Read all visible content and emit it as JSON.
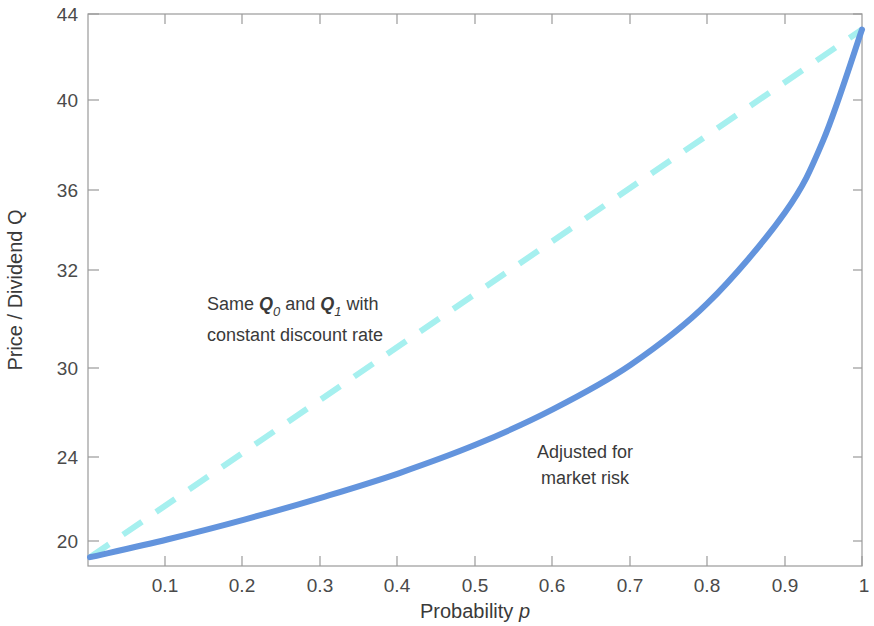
{
  "chart_data": {
    "type": "line",
    "title": "",
    "xlabel": "Probability p",
    "ylabel": "Price / Dividend Q",
    "xlim": [
      0,
      1
    ],
    "ylim": [
      19.0,
      44.0
    ],
    "grid": false,
    "legend_position": "none",
    "xticks": [
      "0.1",
      "0.2",
      "0.3",
      "0.4",
      "0.5",
      "0.6",
      "0.7",
      "0.8",
      "0.9",
      "1"
    ],
    "xtick_values": [
      0.1,
      0.2,
      0.3,
      0.4,
      0.5,
      0.6,
      0.7,
      0.8,
      0.9,
      1.0
    ],
    "yticks": [
      "44",
      "40",
      "36",
      "32",
      "30",
      "24",
      "20"
    ],
    "ytick_values": [
      44,
      40,
      36,
      32,
      30,
      24,
      20
    ],
    "series": [
      {
        "name": "Same Q0 and Q1 with constant discount rate",
        "style": "dashed",
        "color": "#a6f0ef",
        "x": [
          0.0,
          0.1,
          0.2,
          0.3,
          0.4,
          0.5,
          0.6,
          0.7,
          0.8,
          0.9,
          1.0
        ],
        "values": [
          19.4,
          21.8,
          24.2,
          26.6,
          29.0,
          31.4,
          33.8,
          36.2,
          38.6,
          41.0,
          43.3
        ]
      },
      {
        "name": "Adjusted for market risk",
        "style": "solid",
        "color": "#6394dd",
        "x": [
          0.0,
          0.1,
          0.2,
          0.3,
          0.4,
          0.5,
          0.6,
          0.7,
          0.8,
          0.9,
          0.95,
          1.0
        ],
        "values": [
          19.4,
          20.2,
          21.1,
          22.1,
          23.2,
          24.5,
          26.1,
          28.1,
          30.9,
          35.0,
          38.3,
          43.3
        ]
      }
    ],
    "annotations": [
      {
        "name": "dashed-line-annotation",
        "line1_pre": "Same ",
        "line1_q0": "Q",
        "line1_q0sub": "0",
        "line1_mid": " and ",
        "line1_q1": "Q",
        "line1_q1sub": "1",
        "line1_post": " with",
        "line2": "constant discount rate"
      },
      {
        "name": "solid-line-annotation",
        "line1": "Adjusted for",
        "line2": "market risk"
      }
    ],
    "axis_label_parts": {
      "x_main": "Probability",
      "x_var": "p",
      "y_main": "Price / Dividend Q"
    },
    "colors": {
      "dashed_series": "#a6f0ef",
      "solid_series": "#6394dd",
      "axis": "#9a9a9a",
      "text": "#3a3a3a",
      "background": "#ffffff"
    }
  }
}
